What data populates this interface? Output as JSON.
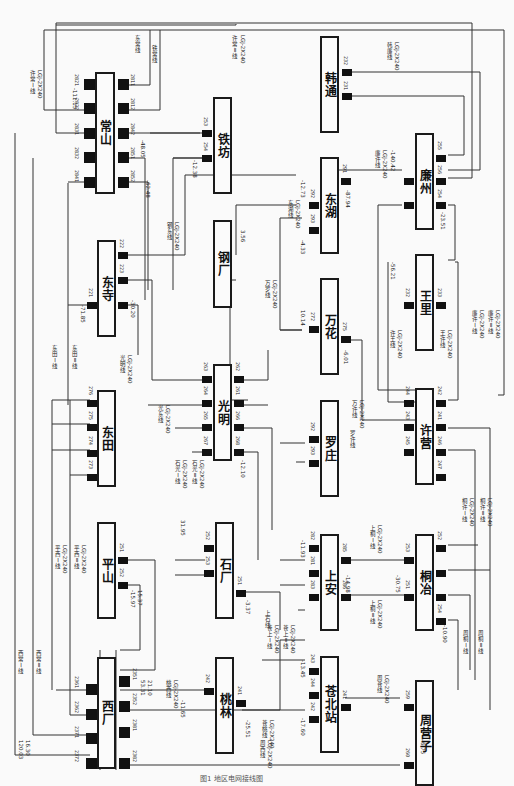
{
  "figure": {
    "orientation": "rotated-90-cw",
    "caption": "图1 地区电网接线图"
  },
  "stations": [
    {
      "id": "changshan",
      "name": "常山"
    },
    {
      "id": "tiefang",
      "name": "铁坊"
    },
    {
      "id": "hantong",
      "name": "韩通"
    },
    {
      "id": "dongsi",
      "name": "东寺"
    },
    {
      "id": "gangchang",
      "name": "钢厂"
    },
    {
      "id": "donghu",
      "name": "东湖"
    },
    {
      "id": "lianzhou",
      "name": "廉州"
    },
    {
      "id": "wanhua",
      "name": "万花"
    },
    {
      "id": "wangli",
      "name": "王里"
    },
    {
      "id": "dongtian",
      "name": "东田"
    },
    {
      "id": "guangming",
      "name": "光明"
    },
    {
      "id": "luozhuang",
      "name": "罗庄"
    },
    {
      "id": "xuying",
      "name": "许营"
    },
    {
      "id": "pingshan",
      "name": "平山"
    },
    {
      "id": "shichang",
      "name": "石厂"
    },
    {
      "id": "shangan",
      "name": "上安"
    },
    {
      "id": "tongye",
      "name": "桐冶"
    },
    {
      "id": "xichang",
      "name": "西厂"
    },
    {
      "id": "taolin",
      "name": "桃林"
    },
    {
      "id": "cangbeizhan",
      "name": "苍北站"
    },
    {
      "id": "zhouyingzi",
      "name": "周营子"
    }
  ],
  "breakers": {
    "tiefang": [
      "253",
      "254"
    ],
    "hantong": [
      "232",
      "231"
    ],
    "dongsi": [
      "221",
      "222",
      "223"
    ],
    "donghu": [
      "292",
      "293",
      "291"
    ],
    "lianzhou": [
      "255",
      "256",
      "254"
    ],
    "wanhua": [
      "272",
      "275"
    ],
    "wangli": [
      "232",
      "233"
    ],
    "dongtian": [
      "276",
      "275",
      "274",
      "273"
    ],
    "guangming": [
      "263",
      "264",
      "265",
      "267",
      "262",
      "261",
      "266",
      "268"
    ],
    "luozhuang": [
      "292",
      "293"
    ],
    "xuying": [
      "244",
      "243",
      "245",
      "242",
      "241",
      "246",
      "247"
    ],
    "pingshan": [
      "251",
      "252"
    ],
    "shichang": [
      "252",
      "253",
      "251"
    ],
    "shangan": [
      "282",
      "281",
      "283",
      "285",
      "286"
    ],
    "tongye": [
      "253",
      "251",
      "252",
      "254"
    ],
    "taolin": [
      "242",
      "241"
    ],
    "cangbeizhan": [
      "243",
      "244",
      "242",
      "241"
    ],
    "zhouyingzi": [
      "259",
      "260"
    ],
    "changshan": [
      "2821",
      "2822",
      "2831",
      "2832",
      "2841",
      "2811",
      "2812",
      "2842",
      "2851",
      "2852"
    ],
    "xichang": [
      "2361",
      "2362",
      "2371",
      "2372",
      "2351",
      "2352",
      "2381",
      "2382"
    ]
  },
  "line_labels": {
    "conductor_type": "LGJ-2X240",
    "lines": [
      "许常Ⅰ线",
      "许常Ⅱ线",
      "东常线",
      "铁常线",
      "钢东线",
      "东湖线",
      "廉许线",
      "韩廉线",
      "万许线",
      "万罗线",
      "东田Ⅰ线",
      "东田Ⅱ线",
      "光东线",
      "光明线",
      "罗许线",
      "许王线",
      "王许线",
      "廉许Ⅰ线",
      "廉许Ⅱ线",
      "平西Ⅰ线",
      "平西Ⅱ线",
      "石光Ⅰ线",
      "石光Ⅱ线",
      "上石线",
      "上桐Ⅰ线",
      "上桐Ⅱ线",
      "桐许Ⅰ线",
      "桐许Ⅱ线",
      "桃西线",
      "苍上Ⅰ线",
      "苍上Ⅱ线",
      "苍桃线",
      "周苍线",
      "周西线",
      "西常Ⅰ线",
      "西常Ⅱ线",
      "周桐Ⅰ线",
      "周桐Ⅱ线"
    ]
  },
  "flow_values": [
    "120.03",
    "16.30",
    "-111.15",
    "-48.05",
    "-12.38",
    "-87.94",
    "-12.73",
    "-4.33",
    "-23.51",
    "-6.01",
    "10.14",
    "-56.21",
    "-71.85",
    "3.56",
    "-11.65",
    "-17.60",
    "-13.45",
    "53.31",
    "21.10",
    "-15.97",
    "15.37",
    "-62.48",
    "-3.37",
    "-11.93",
    "-6.75",
    "-30.75",
    "-140.42",
    "31.95",
    "-12.10",
    "-30.20",
    "-14.98",
    "-10.90",
    "-25.51"
  ]
}
